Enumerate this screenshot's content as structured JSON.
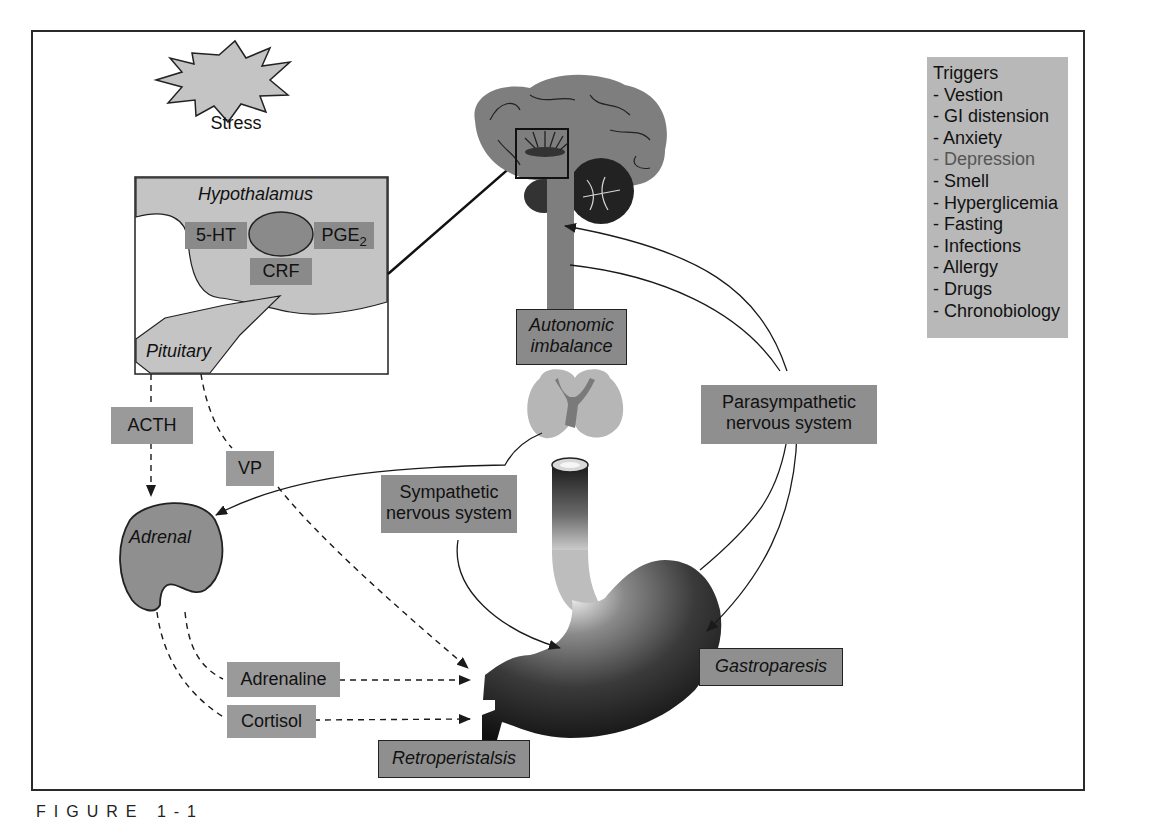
{
  "figure": {
    "caption": "FIGURE 1-1"
  },
  "stress": {
    "label": "Stress"
  },
  "hypothalamus_panel": {
    "title": "Hypothalamus",
    "left_label": "5-HT",
    "right_label_main": "PGE",
    "right_label_sub": "2",
    "bottom_label": "CRF",
    "pituitary_label": "Pituitary"
  },
  "hormones": {
    "acth": "ACTH",
    "vp": "VP",
    "adrenal": "Adrenal",
    "adrenaline": "Adrenaline",
    "cortisol": "Cortisol"
  },
  "nervous": {
    "autonomic_line1": "Autonomic",
    "autonomic_line2": "imbalance",
    "sympathetic_line1": "Sympathetic",
    "sympathetic_line2": "nervous system",
    "parasympathetic_line1": "Parasympathetic",
    "parasympathetic_line2": "nervous system"
  },
  "outcomes": {
    "gastroparesis": "Gastroparesis",
    "retroperistalsis": "Retroperistalsis"
  },
  "triggers": {
    "title": "Triggers",
    "items": [
      "- Vestion",
      "- GI distension",
      "- Anxiety",
      "- Depression",
      "- Smell",
      "- Hyperglicemia",
      "- Fasting",
      "- Infections",
      "- Allergy",
      "- Drugs",
      "- Chronobiology"
    ]
  },
  "colors": {
    "label_fill": "#8f8f8f",
    "trigger_fill": "#b8b8b8",
    "hypothalamus_fill": "#c4c4c4",
    "brain_fill": "#7e7e7e",
    "line": "#1a1a1a"
  }
}
